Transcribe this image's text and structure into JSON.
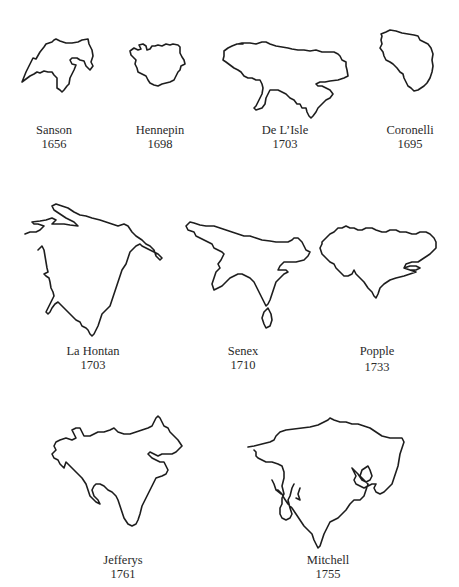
{
  "figure": {
    "maps": [
      {
        "id": "sanson",
        "cartographer": "Sanson",
        "year": "1656",
        "row": 1
      },
      {
        "id": "hennepin",
        "cartographer": "Hennepin",
        "year": "1698",
        "row": 1
      },
      {
        "id": "delisle",
        "cartographer": "De L’Isle",
        "year": "1703",
        "row": 1
      },
      {
        "id": "coronelli",
        "cartographer": "Coronelli",
        "year": "1695",
        "row": 1
      },
      {
        "id": "lahontan",
        "cartographer": "La Hontan",
        "year": "1703",
        "row": 2
      },
      {
        "id": "senex",
        "cartographer": "Senex",
        "year": "1710",
        "row": 2
      },
      {
        "id": "popple",
        "cartographer": "Popple",
        "year": "1733",
        "row": 2
      },
      {
        "id": "jefferys",
        "cartographer": "Jefferys",
        "year": "1761",
        "row": 3
      },
      {
        "id": "mitchell",
        "cartographer": "Mitchell",
        "year": "1755",
        "row": 3
      }
    ]
  },
  "colors": {
    "background": "#ffffff",
    "outline": "#1e1e1e",
    "text": "#2a2a2a"
  }
}
